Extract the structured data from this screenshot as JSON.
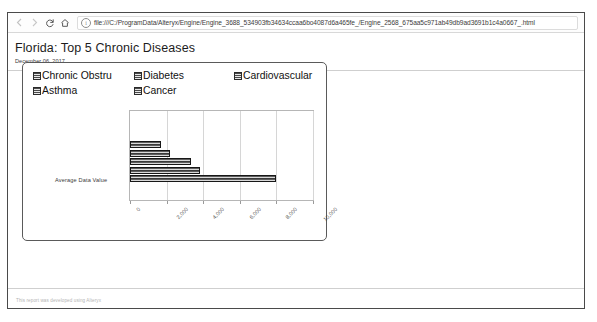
{
  "browser": {
    "back_icon": "arrow-left-icon",
    "forward_icon": "arrow-right-icon",
    "reload_icon": "reload-icon",
    "home_icon": "home-icon",
    "info_icon": "info-circle-icon",
    "url": "file:///C:/ProgramData/Alteryx/Engine/Engine_3688_534903fb34634ccaa6bo4087d6a465fe_/Engine_2568_675aa5c971ab49db9ad3691b1c4a0667_.html"
  },
  "report": {
    "title": "Florida: Top 5 Chronic Diseases",
    "date": "December 06, 2017",
    "footer": "This report was developed using Alteryx"
  },
  "chart_data": {
    "type": "bar",
    "orientation": "horizontal",
    "title": "",
    "xlabel": "",
    "ylabel": "Average Data Value",
    "categories": [
      "Chronic Obstru",
      "Diabetes",
      "Cardiovascular",
      "Asthma",
      "Cancer"
    ],
    "values": [
      1670,
      2190,
      3330,
      3850,
      8000
    ],
    "xlim": [
      0,
      10000
    ],
    "xticks": [
      0,
      2000,
      4000,
      6000,
      8000,
      10000
    ],
    "xticklabels": [
      "0",
      "2,000",
      "4,000",
      "6,000",
      "8,000",
      "10,000"
    ],
    "grid": true,
    "legend_position": "top",
    "legend": [
      "Chronic Obstru",
      "Diabetes",
      "Cardiovascular",
      "Asthma",
      "Cancer"
    ],
    "series_color": "#4a4a4a"
  }
}
